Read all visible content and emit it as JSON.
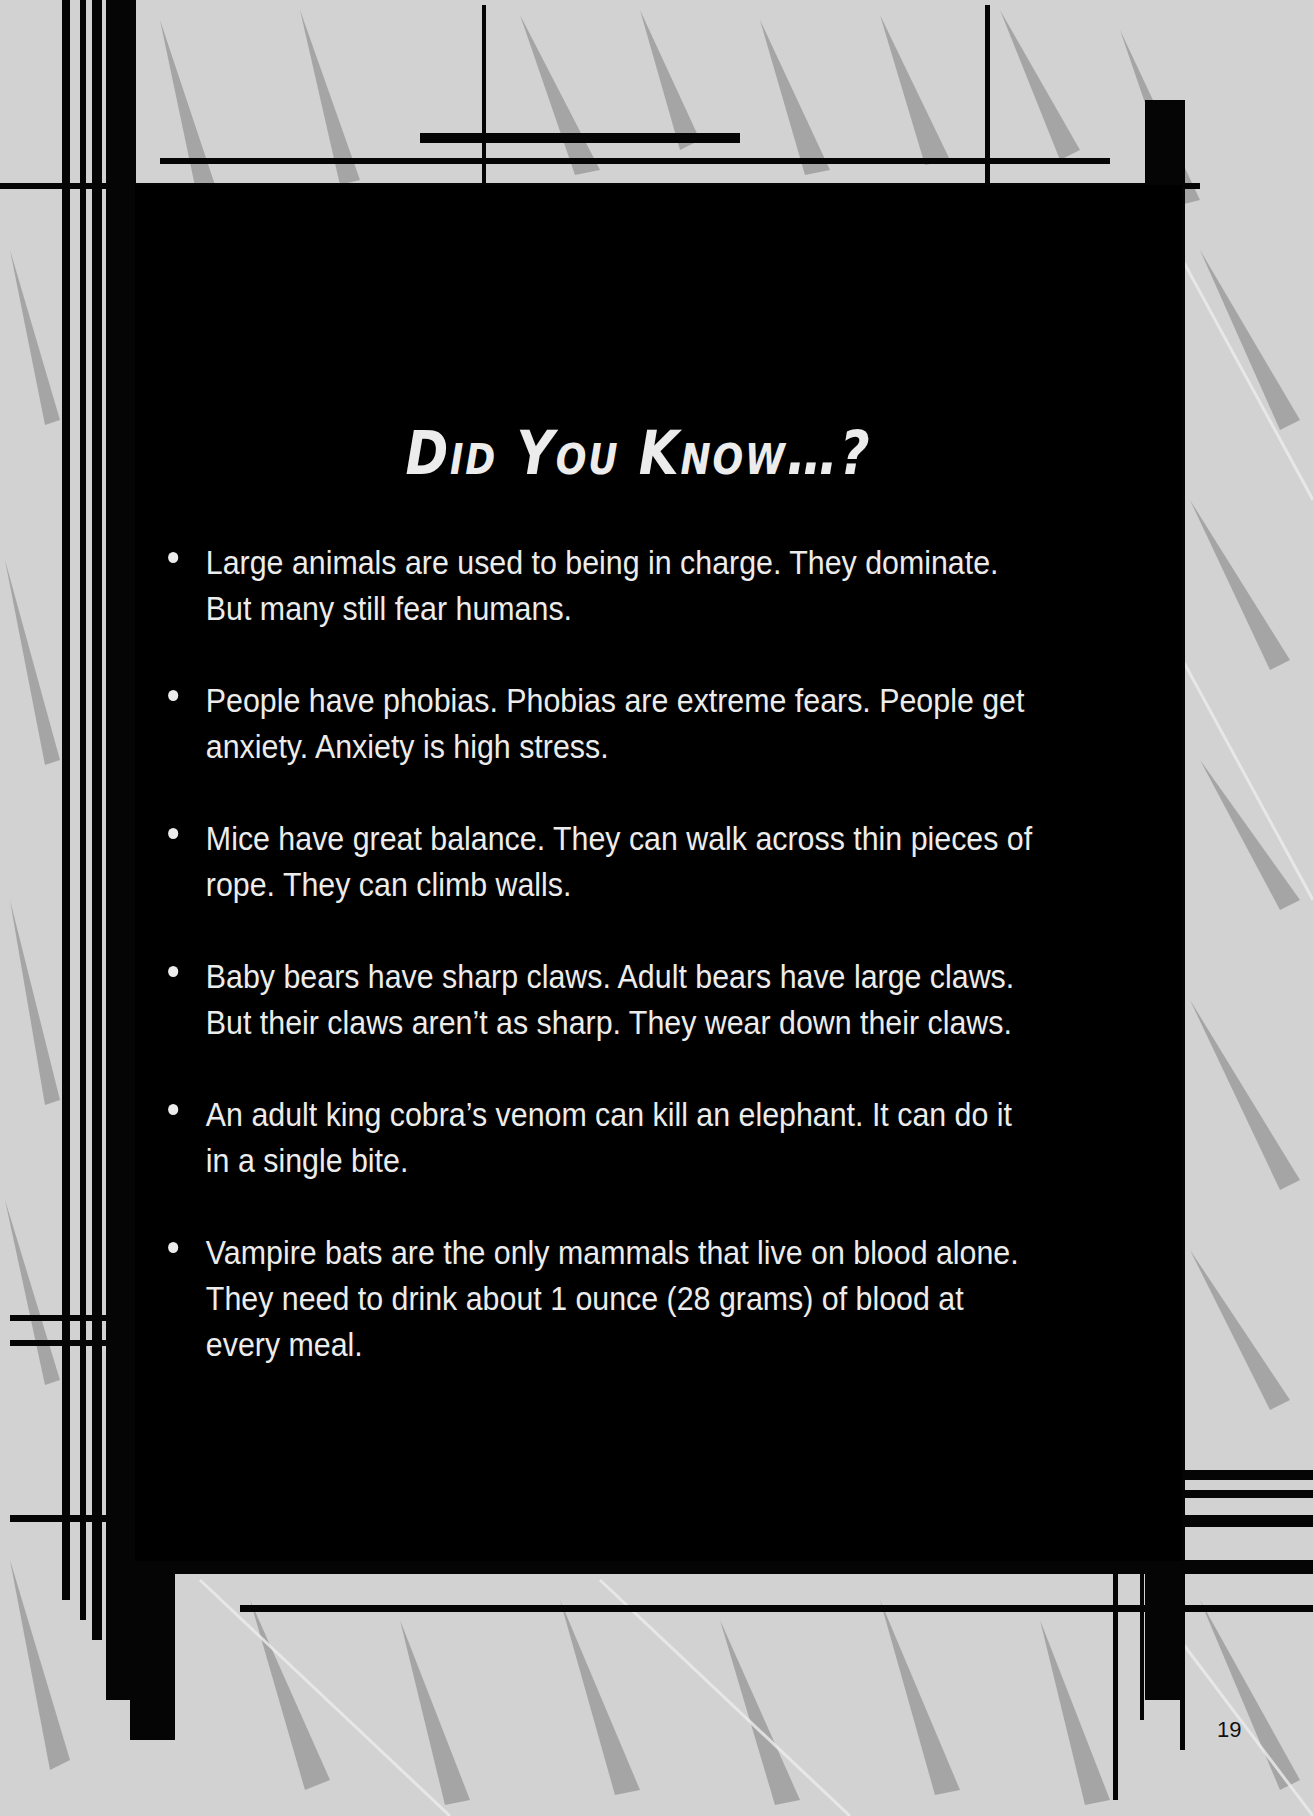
{
  "page": {
    "title": "Did You Know…?",
    "page_number": "19",
    "colors": {
      "panel": "#000000",
      "text": "#ececec",
      "background_light": "#d2d2d2",
      "background_streak": "#9e9e9e"
    }
  },
  "facts": [
    {
      "text": "Large animals are used to being in charge. They dominate. But many still fear humans."
    },
    {
      "text": "People have phobias. Phobias are extreme fears. People get anxiety. Anxiety is high stress."
    },
    {
      "text": "Mice have great balance. They can walk across thin pieces of rope. They can climb walls."
    },
    {
      "text": "Baby bears have sharp claws. Adult bears have large claws. But their claws aren’t as sharp. They wear down their claws."
    },
    {
      "text": "An adult king cobra’s venom can kill an elephant. It can do it in a single bite."
    },
    {
      "text": "Vampire bats are the only mammals that live on blood alone. They need to drink about 1 ounce (28 grams) of blood at every meal."
    }
  ]
}
